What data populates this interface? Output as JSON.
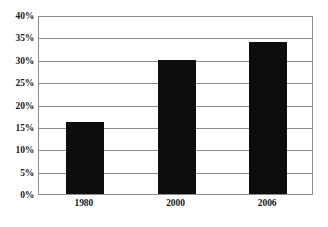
{
  "chart_data": {
    "type": "bar",
    "title": "",
    "subtitle": "",
    "xlabel": "",
    "ylabel": "",
    "categories": [
      "1980",
      "2000",
      "2006"
    ],
    "values": [
      16,
      30,
      34
    ],
    "value_labels": [
      "16%",
      "30%",
      "34%"
    ],
    "ylim": [
      0,
      40
    ],
    "ytick_values": [
      0,
      5,
      10,
      15,
      20,
      25,
      30,
      35,
      40
    ],
    "ytick_labels": [
      "0%",
      "5%",
      "10%",
      "15%",
      "20%",
      "25%",
      "30%",
      "35%",
      "40%"
    ],
    "grid": true,
    "grid_axis": "y",
    "legend": false,
    "legend_position": "none",
    "series": [
      {
        "name": "",
        "values": [
          16,
          30,
          34
        ]
      }
    ],
    "colors": {
      "bar": "#0d0d0d",
      "grid": "#8c8c8c",
      "frame": "#8c8c8c",
      "text": "#1a1a1a",
      "background": "#ffffff"
    }
  }
}
